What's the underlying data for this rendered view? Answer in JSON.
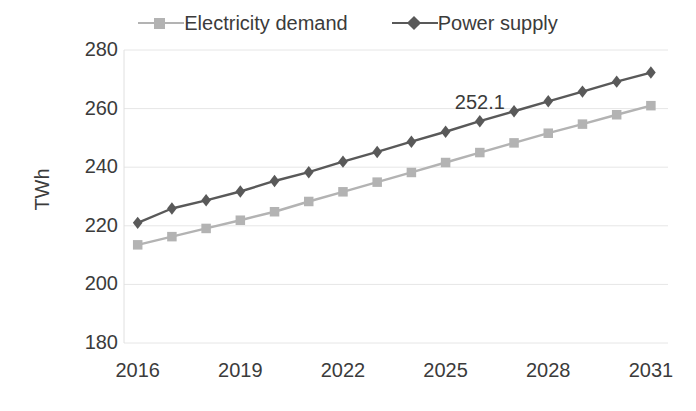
{
  "chart_data": {
    "type": "line",
    "title": "",
    "subtitle": "",
    "xlabel": "",
    "ylabel": "TWh",
    "x": [
      2016,
      2017,
      2018,
      2019,
      2020,
      2021,
      2022,
      2023,
      2024,
      2025,
      2026,
      2027,
      2028,
      2029,
      2030,
      2031
    ],
    "xtick_labels": [
      "2016",
      "2019",
      "2022",
      "2025",
      "2028",
      "2031"
    ],
    "xtick_values": [
      2016,
      2019,
      2022,
      2025,
      2028,
      2031
    ],
    "xlim": [
      2015.6,
      2031.5
    ],
    "ytick_labels": [
      "180",
      "200",
      "220",
      "240",
      "260",
      "280"
    ],
    "ytick_values": [
      180,
      200,
      220,
      240,
      260,
      280
    ],
    "ylim": [
      180,
      280
    ],
    "grid": true,
    "grid_axis": "y",
    "legend_position": "top-center",
    "series": [
      {
        "name": "Electricity demand",
        "color": "#b3b3b3",
        "marker": "square",
        "values": [
          213.5,
          216.3,
          219.1,
          221.9,
          224.8,
          228.3,
          231.6,
          234.9,
          238.2,
          241.6,
          245.0,
          248.3,
          251.6,
          254.7,
          257.9,
          261.0
        ]
      },
      {
        "name": "Power supply",
        "color": "#595959",
        "marker": "diamond",
        "values": [
          221.0,
          225.9,
          228.7,
          231.7,
          235.3,
          238.3,
          241.9,
          245.2,
          248.7,
          252.1,
          255.7,
          259.1,
          262.5,
          265.8,
          269.2,
          272.3
        ]
      }
    ],
    "annotations": [
      {
        "text": "252.1",
        "x": 2026,
        "y": 252.1,
        "series": "Power supply",
        "dx": 0,
        "dy": 30
      }
    ]
  },
  "legend": {
    "items": [
      {
        "label": "Electricity demand",
        "marker": "legend-square-marker-electricity-demand"
      },
      {
        "label": "Power supply",
        "marker": "legend-diamond-marker-power-supply"
      }
    ]
  },
  "colors": {
    "electricity_demand": "#b3b3b3",
    "power_supply": "#595959",
    "grid": "#e6e6e6",
    "text": "#3b3b3b",
    "background": "#ffffff"
  }
}
